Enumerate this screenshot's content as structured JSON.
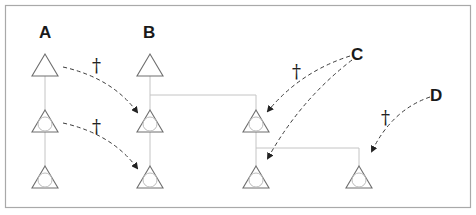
{
  "diagram": {
    "type": "pedigree-lineage-diagram",
    "colors": {
      "frame": "#a9a9a9",
      "node_stroke": "#6e6e6e",
      "link": "#c4c4c4",
      "arrow": "#3a3a3a",
      "text": "#1a1a1a"
    },
    "labels": {
      "A": "A",
      "B": "B",
      "C": "C",
      "D": "D"
    },
    "dagger_symbol": "†",
    "daggers": [
      {
        "id": "dagger-1",
        "x": 97,
        "y": 69
      },
      {
        "id": "dagger-2",
        "x": 97,
        "y": 131
      },
      {
        "id": "dagger-3",
        "x": 297,
        "y": 76
      },
      {
        "id": "dagger-4",
        "x": 386,
        "y": 122
      }
    ],
    "nodes": [
      {
        "id": "A1",
        "column": "A",
        "x": 45,
        "y": 54,
        "inner_circle": false
      },
      {
        "id": "A2",
        "column": "A",
        "x": 45,
        "y": 110,
        "inner_circle": true
      },
      {
        "id": "A3",
        "column": "A",
        "x": 45,
        "y": 166,
        "inner_circle": true
      },
      {
        "id": "B1",
        "column": "B",
        "x": 150,
        "y": 54,
        "inner_circle": false
      },
      {
        "id": "B2",
        "column": "B",
        "x": 150,
        "y": 110,
        "inner_circle": true
      },
      {
        "id": "B3",
        "column": "B",
        "x": 150,
        "y": 166,
        "inner_circle": true
      },
      {
        "id": "C1",
        "column": "C",
        "x": 256,
        "y": 110,
        "inner_circle": true
      },
      {
        "id": "C2",
        "column": "C",
        "x": 256,
        "y": 166,
        "inner_circle": true
      },
      {
        "id": "D1",
        "column": "D",
        "x": 359,
        "y": 166,
        "inner_circle": true
      }
    ],
    "arrows": [
      {
        "from": "A1",
        "to": "B2",
        "label": "†"
      },
      {
        "from": "A2",
        "to": "B3",
        "label": "†"
      },
      {
        "from": "C",
        "to": "C1",
        "label": "†"
      },
      {
        "from": "C",
        "to": "C2",
        "label": ""
      },
      {
        "from": "D",
        "to": "D1",
        "label": "†"
      }
    ]
  }
}
